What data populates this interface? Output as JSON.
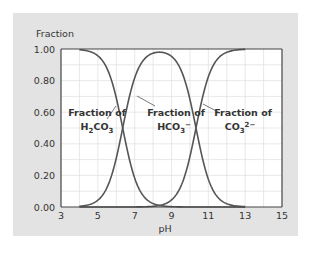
{
  "chart_data": {
    "type": "line",
    "title": "",
    "xlabel": "pH",
    "ylabel": "Fraction",
    "xlim": [
      3,
      15
    ],
    "ylim": [
      0,
      1
    ],
    "xticks": [
      "3",
      "5",
      "7",
      "9",
      "11",
      "13",
      "15"
    ],
    "yticks": [
      "0.00",
      "0.20",
      "0.40",
      "0.60",
      "0.80",
      "1.00"
    ],
    "grid": true,
    "pKa1": 6.35,
    "pKa2": 10.33,
    "x_range_plotted": [
      4,
      13
    ],
    "series": [
      {
        "name": "Fraction of H2CO3",
        "species": "H2CO3",
        "points": [
          [
            4,
            1.0
          ],
          [
            5,
            0.96
          ],
          [
            6,
            0.69
          ],
          [
            6.35,
            0.5
          ],
          [
            7,
            0.18
          ],
          [
            8,
            0.02
          ],
          [
            9,
            0.0
          ],
          [
            10,
            0.0
          ],
          [
            11,
            0.0
          ],
          [
            12,
            0.0
          ],
          [
            13,
            0.0
          ]
        ]
      },
      {
        "name": "Fraction of HCO3-",
        "species": "HCO3-",
        "points": [
          [
            4,
            0.0
          ],
          [
            5,
            0.04
          ],
          [
            6,
            0.31
          ],
          [
            6.35,
            0.5
          ],
          [
            7,
            0.82
          ],
          [
            8,
            0.97
          ],
          [
            8.3,
            0.98
          ],
          [
            9,
            0.95
          ],
          [
            10,
            0.68
          ],
          [
            10.33,
            0.5
          ],
          [
            11,
            0.18
          ],
          [
            12,
            0.02
          ],
          [
            13,
            0.0
          ]
        ]
      },
      {
        "name": "Fraction of CO3 2-",
        "species": "CO3 2-",
        "points": [
          [
            4,
            0.0
          ],
          [
            8,
            0.0
          ],
          [
            9,
            0.04
          ],
          [
            10,
            0.32
          ],
          [
            10.33,
            0.5
          ],
          [
            11,
            0.82
          ],
          [
            12,
            0.98
          ],
          [
            13,
            1.0
          ]
        ]
      }
    ],
    "annotations": [
      {
        "text_line1": "Fraction of",
        "formula": "H2CO3"
      },
      {
        "text_line1": "Fraction of",
        "formula": "HCO3−"
      },
      {
        "text_line1": "Fraction of",
        "formula": "CO3 2−"
      }
    ]
  },
  "labels": {
    "ylabel": "Fraction",
    "xlabel": "pH",
    "fraction_of": "Fraction of",
    "h2co3_a": "H",
    "h2co3_sub1": "2",
    "h2co3_b": "CO",
    "h2co3_sub2": "3",
    "hco3_a": "HCO",
    "hco3_sub": "3",
    "hco3_sup": "−",
    "co3_a": "CO",
    "co3_sub": "3",
    "co3_sup": "2−"
  },
  "colors": {
    "panel": "#e3e3e3",
    "plot_bg": "#ffffff",
    "grid": "#e0e0e0",
    "curve": "#555555",
    "axis": "#444444"
  }
}
